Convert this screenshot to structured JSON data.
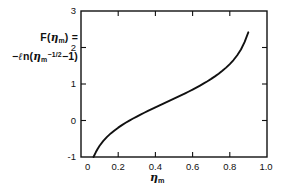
{
  "chart_data": {
    "type": "line",
    "title": "",
    "subtitle": "",
    "xlabel": "η_m",
    "ylabel": "F(η_m) = -ln(η_m^-1/2 - 1)",
    "xlim": [
      0,
      1.0
    ],
    "ylim": [
      -1,
      3
    ],
    "grid": false,
    "legend": "none",
    "x_ticks": [
      "0",
      "0.2",
      "0.4",
      "0.6",
      "0.8",
      "1.0"
    ],
    "x_tick_values": [
      0,
      0.2,
      0.4,
      0.6,
      0.8,
      1.0
    ],
    "y_ticks": [
      "-1",
      "0",
      "1",
      "2",
      "3"
    ],
    "y_tick_values": [
      -1,
      0,
      1,
      2,
      3
    ],
    "series": [
      {
        "name": "F(η_m)",
        "x": [
          0.0671,
          0.08,
          0.09,
          0.1,
          0.12,
          0.14,
          0.16,
          0.18,
          0.2,
          0.22,
          0.24,
          0.26,
          0.28,
          0.3,
          0.32,
          0.34,
          0.36,
          0.38,
          0.4,
          0.42,
          0.44,
          0.46,
          0.48,
          0.5,
          0.52,
          0.54,
          0.56,
          0.58,
          0.6,
          0.62,
          0.64,
          0.66,
          0.68,
          0.7,
          0.72,
          0.74,
          0.76,
          0.78,
          0.8,
          0.82,
          0.84,
          0.86,
          0.88,
          0.8997
        ],
        "y": [
          -1.0,
          -0.864,
          -0.772,
          -0.692,
          -0.559,
          -0.449,
          -0.354,
          -0.271,
          -0.196,
          -0.127,
          -0.063,
          -0.003,
          0.054,
          0.108,
          0.161,
          0.212,
          0.262,
          0.311,
          0.359,
          0.407,
          0.454,
          0.502,
          0.549,
          0.597,
          0.645,
          0.694,
          0.744,
          0.795,
          0.847,
          0.901,
          0.957,
          1.015,
          1.076,
          1.14,
          1.209,
          1.282,
          1.362,
          1.449,
          1.546,
          1.657,
          1.787,
          1.945,
          2.152,
          2.417
        ]
      }
    ],
    "curve_equation": "F(η_m) = -ln(η_m^(-1/2) - 1)",
    "axes_box": "all four sides drawn with inward ticks"
  },
  "ylabel": {
    "line1_prefix": "F(",
    "line1_eta": "η",
    "line1_sub": "m",
    "line1_suffix": ") =",
    "line2_minus": "−",
    "line2_ell": "ℓ",
    "line2_n": "n(",
    "line2_eta": "η",
    "line2_sub": "m",
    "line2_sup": "−1/2",
    "line2_tail": "−1)"
  },
  "xlabel": {
    "eta": "η",
    "sub": "m"
  },
  "colors": {
    "ink": "#111111",
    "background": "#ffffff"
  }
}
